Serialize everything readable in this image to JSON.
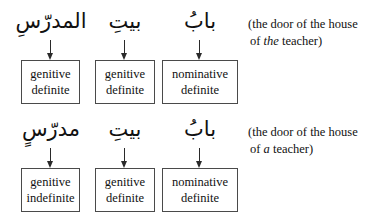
{
  "figure": {
    "type": "grammar-annotation-diagram",
    "background_color": "#ffffff",
    "box_border_color": "#4a4a4a",
    "text_color": "#111111",
    "rows": [
      {
        "id": "definite-construct",
        "arabic_terms": [
          {
            "text": "المدرّسِ",
            "transliteration": "al-mudarrisi",
            "position": "left"
          },
          {
            "text": "بيتِ",
            "transliteration": "bayti",
            "position": "middle"
          },
          {
            "text": "بابُ",
            "transliteration": "babu",
            "position": "right"
          }
        ],
        "boxes": [
          {
            "line1": "genitive",
            "line2": "definite"
          },
          {
            "line1": "genitive",
            "line2": "definite"
          },
          {
            "line1": "nominative",
            "line2": "definite"
          }
        ],
        "gloss": {
          "line1": "(the door of the house",
          "line2_before": "of ",
          "line2_italic": "the",
          "line2_after": " teacher)"
        }
      },
      {
        "id": "indefinite-construct",
        "arabic_terms": [
          {
            "text": "مدرّسٍ",
            "transliteration": "mudarrisin",
            "position": "left"
          },
          {
            "text": "بيتِ",
            "transliteration": "bayti",
            "position": "middle"
          },
          {
            "text": "بابُ",
            "transliteration": "babu",
            "position": "right"
          }
        ],
        "boxes": [
          {
            "line1": "genitive",
            "line2": "indefinite"
          },
          {
            "line1": "genitive",
            "line2": "definite"
          },
          {
            "line1": "nominative",
            "line2": "definite"
          }
        ],
        "gloss": {
          "line1": "(the door of the house",
          "line2_before": " of ",
          "line2_italic": "a",
          "line2_after": " teacher)"
        }
      }
    ],
    "arrow_icon": "arrow-down-icon"
  }
}
